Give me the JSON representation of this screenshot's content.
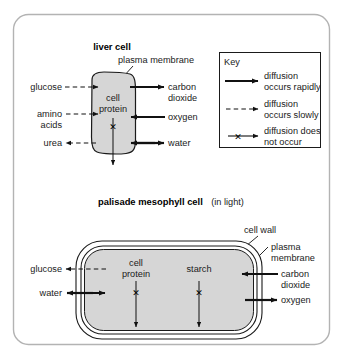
{
  "panel": {
    "background": "#ffffff",
    "border_color": "#b0b0b0",
    "cell_fill": "#d4d4d4",
    "stroke": "#1a1a1a"
  },
  "liver": {
    "title": "liver cell",
    "membrane_label": "plasma membrane",
    "interior_label_line1": "cell",
    "interior_label_line2": "protein",
    "no_diffusion_mark": "✕",
    "left_labels": [
      {
        "text": "glucose",
        "type": "slow-in"
      },
      {
        "text_line1": "amino",
        "text_line2": "acids",
        "type": "slow-in"
      },
      {
        "text": "urea",
        "type": "slow-out"
      }
    ],
    "right_labels": [
      {
        "line1": "carbon",
        "line2": "dioxide",
        "type": "rapid-out"
      },
      {
        "line1": "oxygen",
        "line2": "",
        "type": "rapid-in"
      },
      {
        "line1": "water",
        "line2": "",
        "type": "rapid-both"
      }
    ]
  },
  "key": {
    "title": "Key",
    "items": [
      {
        "line1": "diffusion",
        "line2": "occurs rapidly",
        "icon": "solid-arrow"
      },
      {
        "line1": "diffusion",
        "line2": "occurs slowly",
        "icon": "dashed-arrow"
      },
      {
        "line1": "diffusion does",
        "line2": "not occur",
        "icon": "crossed-arrow"
      }
    ]
  },
  "palisade": {
    "title": "palisade mesophyll cell",
    "title_suffix": "(in light)",
    "cell_wall_label": "cell wall",
    "membrane_label_line1": "plasma",
    "membrane_label_line2": "membrane",
    "interior_labels": [
      {
        "line1": "cell",
        "line2": "protein"
      },
      {
        "line1": "starch",
        "line2": ""
      }
    ],
    "no_diffusion_mark": "✕",
    "left_labels": [
      {
        "text": "glucose",
        "type": "slow-out"
      },
      {
        "text": "water",
        "type": "rapid-both"
      }
    ],
    "right_labels": [
      {
        "line1": "carbon",
        "line2": "dioxide",
        "type": "rapid-in"
      },
      {
        "line1": "oxygen",
        "line2": "",
        "type": "rapid-out"
      }
    ]
  }
}
